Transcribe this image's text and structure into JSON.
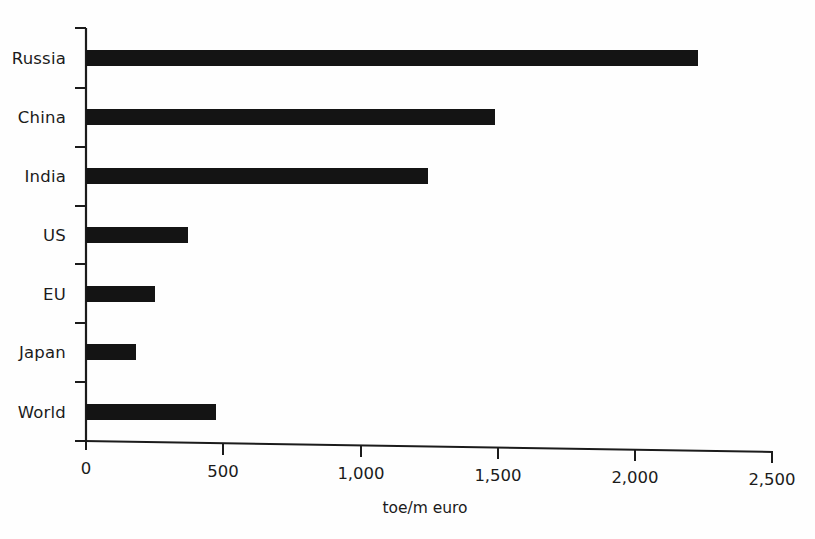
{
  "chart_data": {
    "type": "bar",
    "orientation": "horizontal",
    "title": "",
    "subtitle": "",
    "xlabel": "toe/m euro",
    "ylabel": "",
    "categories": [
      "Russia",
      "China",
      "India",
      "US",
      "EU",
      "Japan",
      "World"
    ],
    "values": [
      2230,
      1490,
      1245,
      372,
      250,
      182,
      474
    ],
    "series": [
      {
        "name": "Energy intensity",
        "values": [
          2230,
          1490,
          1245,
          372,
          250,
          182,
          474
        ]
      }
    ],
    "xlim": [
      0,
      2500
    ],
    "xticks": [
      0,
      500,
      1000,
      1500,
      2000,
      2500
    ],
    "xtick_labels": [
      "0",
      "500",
      "1,000",
      "1,500",
      "2,000",
      "2,500"
    ],
    "grid": false,
    "legend": false,
    "legend_position": "none",
    "bar_color": "#141414",
    "axis_color": "#1b1b1b",
    "background_color": "#fefefe"
  }
}
